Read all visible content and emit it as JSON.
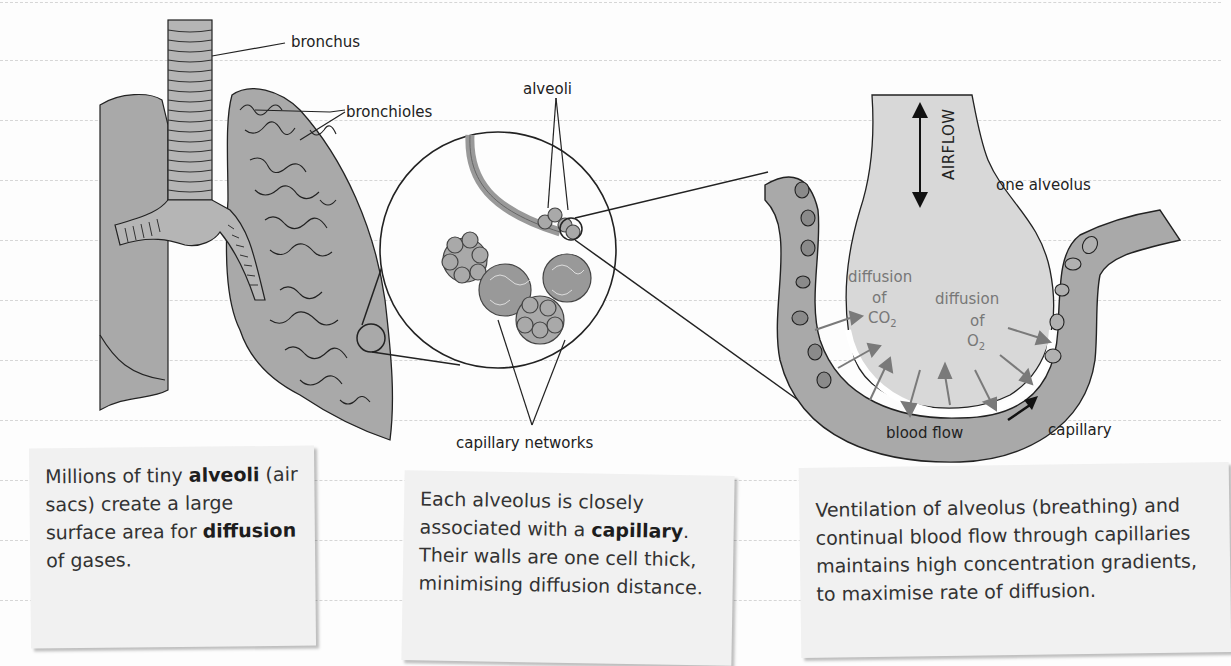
{
  "page": {
    "background": "#fdfdfd",
    "rule_color": "#d6d6d6",
    "rule_ys": [
      2,
      60,
      120,
      180,
      240,
      300,
      360,
      420,
      480,
      540,
      600
    ]
  },
  "colors": {
    "tissue_gray": "#a9a9a9",
    "light_gray": "#dcdcdc",
    "cell_gray": "#8a8a8a",
    "outline": "#222222",
    "card_bg": "#f1f1f1",
    "diffusion_arrow": "#7a7a7a"
  },
  "labels": {
    "bronchus": "bronchus",
    "bronchioles": "bronchioles",
    "alveoli": "alveoli",
    "capillary_networks": "capillary networks",
    "airflow": "AIRFLOW",
    "one_alveolus": "one alveolus",
    "diffusion_co2_line1": "diffusion",
    "diffusion_co2_line2": "of",
    "diffusion_co2_line3": "CO",
    "co2_sub": "2",
    "diffusion_o2_line1": "diffusion",
    "diffusion_o2_line2": "of",
    "diffusion_o2_line3": "O",
    "o2_sub": "2",
    "blood_flow": "blood flow",
    "capillary": "capillary"
  },
  "cards": [
    {
      "id": "alveoli-card",
      "parts": [
        {
          "text": "Millions of tiny ",
          "bold": false
        },
        {
          "text": "alveoli",
          "bold": true
        },
        {
          "text": " (air sacs) create a large surface area for ",
          "bold": false
        },
        {
          "text": "diffusion",
          "bold": true
        },
        {
          "text": " of gases.",
          "bold": false
        }
      ]
    },
    {
      "id": "capillary-card",
      "parts": [
        {
          "text": "Each alveolus is closely associated with a ",
          "bold": false
        },
        {
          "text": "capillary",
          "bold": true
        },
        {
          "text": ". Their walls are one cell thick, minimising diffusion distance.",
          "bold": false
        }
      ]
    },
    {
      "id": "ventilation-card",
      "parts": [
        {
          "text": "Ventilation of alveolus (breathing) and continual blood flow through capillaries maintains high concentration gradients, to maximise rate of diffusion.",
          "bold": false
        }
      ]
    }
  ]
}
